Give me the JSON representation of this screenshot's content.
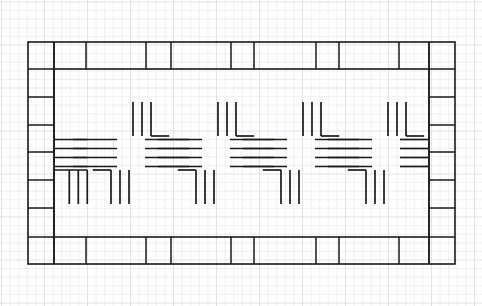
{
  "document": {
    "title": "Graph Paper Technical Drawing",
    "medium": "graph-paper",
    "width": 482,
    "height": 306
  },
  "paper": {
    "background_color": "#ffffff",
    "minor_grid_color": "#e8ecf2",
    "major_grid_color": "#dde3ec",
    "minor_grid_spacing": 8.6,
    "major_grid_every": 5,
    "grid_origin_x": 1.5,
    "grid_origin_y": 2.0
  },
  "ink": {
    "stroke_color": "#1a1a1a",
    "stroke_color_soft": "#3a3a3a",
    "border_stroke_width": 1.6,
    "divider_stroke_width": 1.5,
    "motif_stroke_width": 1.7
  },
  "border_frame": {
    "label": "outer-rectangular-frame",
    "outer": {
      "x": 28,
      "y": 42,
      "width": 427,
      "height": 222
    },
    "band_thickness_top": 27,
    "band_thickness_bottom": 27,
    "band_thickness_left": 26,
    "band_thickness_right": 26,
    "inner": {
      "x": 54,
      "y": 69,
      "width": 375,
      "height": 168
    }
  },
  "top_band": {
    "label": "top-border-band",
    "y_top": 42,
    "y_bottom": 69,
    "divider_x": [
      54,
      86,
      146,
      171,
      231,
      254,
      316,
      339,
      399,
      429
    ]
  },
  "bottom_band": {
    "label": "bottom-border-band",
    "y_top": 237,
    "y_bottom": 264,
    "divider_x": [
      54,
      86,
      146,
      171,
      231,
      254,
      316,
      339,
      399,
      429
    ]
  },
  "left_band": {
    "label": "left-border-band",
    "x_left": 28,
    "x_right": 54,
    "divider_y": [
      69,
      97,
      125,
      152,
      180,
      208,
      237
    ]
  },
  "right_band": {
    "label": "right-border-band",
    "x_left": 429,
    "x_right": 455,
    "divider_y": [
      69,
      97,
      125,
      152,
      180,
      208,
      237
    ]
  },
  "interior_pattern": {
    "label": "repeating-cross-motif-band",
    "motif_name": "pinwheel-cross",
    "description": "Repeating pinwheel cross motif: four groups of horizontal rules paired with groups of vertical rules arranged about a central void.",
    "motif_count": 4,
    "centers_x": [
      131,
      216,
      301,
      386
    ],
    "center_y": 153,
    "pitch_x": 85,
    "half_motif_leading": {
      "x": 46,
      "type": "left-partial"
    },
    "rule_count_horizontal": 4,
    "rule_count_vertical": 3,
    "horizontal_rule_spacing": 9,
    "vertical_rule_spacing": 9,
    "horizontal_rule_length": 44,
    "vertical_rule_length": 34,
    "upper_arm_offset_y": -17,
    "lower_arm_offset_y": 17
  },
  "legend": {
    "stroke_label": "pencil / ink line",
    "grid_label": "graph paper grid"
  }
}
